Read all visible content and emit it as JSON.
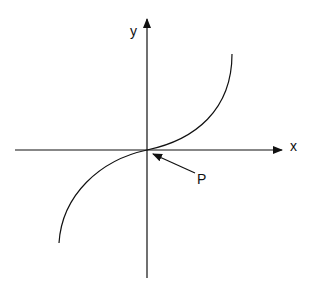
{
  "diagram": {
    "type": "coordinate-graph",
    "axes": {
      "x_label": "x",
      "y_label": "y"
    },
    "curve": "cubic-like curve passing through origin with inflection point",
    "point_label": "P",
    "colors": {
      "stroke": "#111111",
      "background": "#ffffff"
    }
  }
}
